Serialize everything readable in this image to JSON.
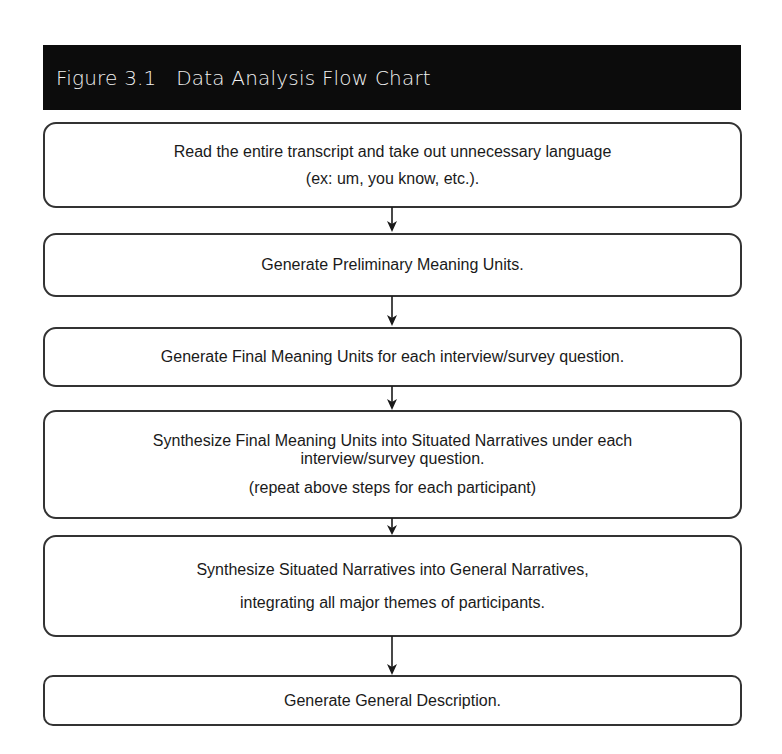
{
  "figure": {
    "title": "Figure 3.1   Data Analysis Flow Chart",
    "colors": {
      "title_bar_bg": "#0c0c0c",
      "title_text": "#f2f2f2",
      "box_border": "#333333",
      "arrow": "#1a1a1a"
    }
  },
  "steps": [
    {
      "lines": [
        "Read the entire transcript and take out unnecessary language",
        "(ex: um, you know, etc.)."
      ]
    },
    {
      "lines": [
        "Generate Preliminary Meaning Units."
      ]
    },
    {
      "lines": [
        "Generate Final Meaning Units for each interview/survey question."
      ]
    },
    {
      "lines": [
        "Synthesize Final Meaning Units into Situated Narratives under each",
        "interview/survey question.",
        "(repeat above steps for each participant)"
      ]
    },
    {
      "lines": [
        "Synthesize Situated Narratives into General Narratives,",
        "integrating all major themes of participants."
      ]
    },
    {
      "lines": [
        "Generate General Description."
      ]
    }
  ],
  "arrows": [
    {
      "from": 1,
      "to": 2
    },
    {
      "from": 2,
      "to": 3
    },
    {
      "from": 3,
      "to": 4
    },
    {
      "from": 4,
      "to": 5
    },
    {
      "from": 5,
      "to": 6
    }
  ]
}
